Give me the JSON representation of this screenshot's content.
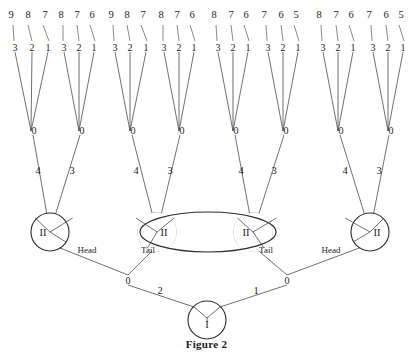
{
  "figure": {
    "caption": "Figure 2",
    "player_root_label": "I",
    "player_second_label": "II",
    "chance_label": "0"
  },
  "root": {
    "label": "I",
    "x": 207,
    "y": 320,
    "r": 19,
    "branches": [
      {
        "label": "2",
        "label_x": 160,
        "label_y": 294,
        "to_x": 128,
        "to_y": 281
      },
      {
        "label": "1",
        "label_x": 256,
        "label_y": 294,
        "to_x": 287,
        "to_y": 281
      }
    ]
  },
  "chance_mid": [
    {
      "label": "0",
      "x": 128,
      "y": 281
    },
    {
      "label": "0",
      "x": 287,
      "y": 281
    }
  ],
  "coin_labels": [
    {
      "text": "Head",
      "x": 87,
      "y": 253
    },
    {
      "text": "Tail",
      "x": 148,
      "y": 253
    },
    {
      "text": "Tail",
      "x": 266,
      "y": 253
    },
    {
      "text": "Head",
      "x": 331,
      "y": 253
    }
  ],
  "second_nodes": [
    {
      "label": "II",
      "x": 50,
      "y": 232,
      "r": 19,
      "in_infoset": false
    },
    {
      "label": "II",
      "x": 157,
      "y": 232,
      "r": 19,
      "in_infoset": true
    },
    {
      "label": "II",
      "x": 253,
      "y": 232,
      "r": 19,
      "in_infoset": true
    },
    {
      "label": "II",
      "x": 370,
      "y": 232,
      "r": 19,
      "in_infoset": false
    }
  ],
  "infoset": {
    "cx": 208,
    "cy": 232,
    "rx": 68,
    "ry": 20
  },
  "second_branch_labels": [
    {
      "label": "4",
      "x": 38,
      "y": 174
    },
    {
      "label": "3",
      "x": 72,
      "y": 174
    },
    {
      "label": "4",
      "x": 136,
      "y": 174
    },
    {
      "label": "3",
      "x": 170,
      "y": 174
    },
    {
      "label": "4",
      "x": 241,
      "y": 174
    },
    {
      "label": "3",
      "x": 274,
      "y": 174
    },
    {
      "label": "4",
      "x": 345,
      "y": 174
    },
    {
      "label": "3",
      "x": 379,
      "y": 174
    }
  ],
  "chance_nodes": [
    {
      "label": "0",
      "x": 34,
      "y": 134
    },
    {
      "label": "0",
      "x": 82,
      "y": 134
    },
    {
      "label": "0",
      "x": 133,
      "y": 134
    },
    {
      "label": "0",
      "x": 182,
      "y": 134
    },
    {
      "label": "0",
      "x": 236,
      "y": 134
    },
    {
      "label": "0",
      "x": 286,
      "y": 134
    },
    {
      "label": "0",
      "x": 341,
      "y": 134
    },
    {
      "label": "0",
      "x": 391,
      "y": 134
    }
  ],
  "leaf_groups": [
    {
      "chance_x": 31,
      "chance_y": 131,
      "actions": [
        "3",
        "2",
        "1"
      ],
      "payoffs": [
        "9",
        "8",
        "7"
      ],
      "action_xs": [
        15,
        32,
        48
      ],
      "payoff_xs": [
        11,
        28,
        45
      ]
    },
    {
      "chance_x": 79,
      "chance_y": 131,
      "actions": [
        "3",
        "2",
        "1"
      ],
      "payoffs": [
        "8",
        "7",
        "6"
      ],
      "action_xs": [
        64,
        79,
        94
      ],
      "payoff_xs": [
        61,
        77,
        92
      ]
    },
    {
      "chance_x": 130,
      "chance_y": 131,
      "actions": [
        "3",
        "2",
        "1"
      ],
      "payoffs": [
        "9",
        "8",
        "7"
      ],
      "action_xs": [
        115,
        130,
        146
      ],
      "payoff_xs": [
        111,
        127,
        143
      ]
    },
    {
      "chance_x": 179,
      "chance_y": 131,
      "actions": [
        "3",
        "2",
        "1"
      ],
      "payoffs": [
        "8",
        "7",
        "6"
      ],
      "action_xs": [
        164,
        179,
        194
      ],
      "payoff_xs": [
        161,
        177,
        192
      ]
    },
    {
      "chance_x": 233,
      "chance_y": 131,
      "actions": [
        "3",
        "2",
        "1"
      ],
      "payoffs": [
        "8",
        "7",
        "6"
      ],
      "action_xs": [
        218,
        233,
        248
      ],
      "payoff_xs": [
        214,
        231,
        246
      ]
    },
    {
      "chance_x": 283,
      "chance_y": 131,
      "actions": [
        "3",
        "2",
        "1"
      ],
      "payoffs": [
        "7",
        "6",
        "5"
      ],
      "action_xs": [
        268,
        283,
        298
      ],
      "payoff_xs": [
        264,
        281,
        296
      ]
    },
    {
      "chance_x": 338,
      "chance_y": 131,
      "actions": [
        "3",
        "2",
        "1"
      ],
      "payoffs": [
        "8",
        "7",
        "6"
      ],
      "action_xs": [
        323,
        338,
        353
      ],
      "payoff_xs": [
        319,
        336,
        351
      ]
    },
    {
      "chance_x": 388,
      "chance_y": 131,
      "actions": [
        "3",
        "2",
        "1"
      ],
      "payoffs": [
        "7",
        "6",
        "5"
      ],
      "action_xs": [
        373,
        388,
        403
      ],
      "payoff_xs": [
        369,
        386,
        401
      ]
    }
  ],
  "geometry": {
    "action_label_y": 48,
    "payoff_label_y": 18,
    "leaf_stub_top_y": 25,
    "leaf_stub_bottom_y": 41,
    "branch_start_y": 52
  }
}
